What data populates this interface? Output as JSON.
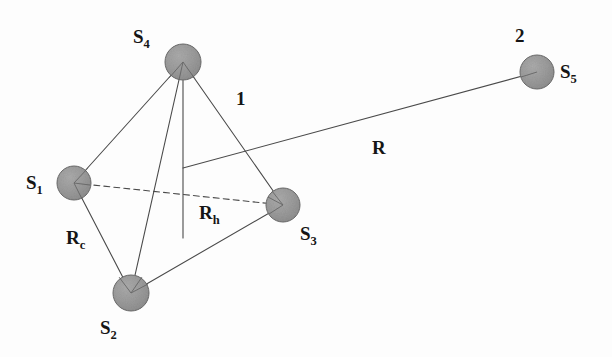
{
  "figure": {
    "type": "diagram",
    "background_color": "#fdfdfd",
    "line_color": "#4a4a4a",
    "node_fill": "#9a9a9a",
    "node_stroke": "#5a5a5a",
    "text_color": "#151515"
  },
  "nodes": [
    {
      "id": "S1",
      "base": "S",
      "sub": "1",
      "cx": 74,
      "cy": 183,
      "r": 17,
      "label_x": 26,
      "label_y": 173
    },
    {
      "id": "S2",
      "base": "S",
      "sub": "2",
      "cx": 131,
      "cy": 293,
      "r": 18,
      "label_x": 100,
      "label_y": 318
    },
    {
      "id": "S3",
      "base": "S",
      "sub": "3",
      "cx": 283,
      "cy": 205,
      "r": 17,
      "label_x": 300,
      "label_y": 224
    },
    {
      "id": "S4",
      "base": "S",
      "sub": "4",
      "cx": 183,
      "cy": 62,
      "r": 18,
      "label_x": 133,
      "label_y": 27
    },
    {
      "id": "S5",
      "base": "S",
      "sub": "5",
      "cx": 537,
      "cy": 72,
      "r": 17,
      "label_x": 560,
      "label_y": 62
    }
  ],
  "edges": [
    {
      "from": "S4",
      "to": "S1",
      "style": "solid"
    },
    {
      "from": "S4",
      "to": "S2",
      "style": "solid"
    },
    {
      "from": "S4",
      "to": "S3",
      "style": "solid"
    },
    {
      "from": "S1",
      "to": "S2",
      "style": "solid"
    },
    {
      "from": "S2",
      "to": "S3",
      "style": "solid"
    },
    {
      "from": "S1",
      "to": "S3",
      "style": "dashed"
    }
  ],
  "height_line": {
    "from": "S4",
    "x": 183,
    "y1": 62,
    "y2": 238,
    "style": "solid"
  },
  "separation_vector": {
    "from_x": 183,
    "from_y": 168,
    "to_x": 537,
    "to_y": 72,
    "style": "solid"
  },
  "labels": {
    "cluster_1": {
      "text": "1",
      "x": 236,
      "y": 89
    },
    "cluster_2": {
      "text": "2",
      "x": 515,
      "y": 26
    },
    "R": {
      "base": "R",
      "sub": "",
      "x": 372,
      "y": 138
    },
    "Rc": {
      "base": "R",
      "sub": "c",
      "x": 66,
      "y": 228
    },
    "Rh": {
      "base": "R",
      "sub": "h",
      "x": 199,
      "y": 203
    }
  }
}
